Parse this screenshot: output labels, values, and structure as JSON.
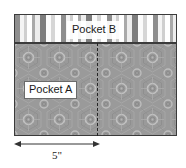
{
  "diagram": {
    "background_color": "#ffffff",
    "outline_color": "#3b3b3b"
  },
  "panels": [
    {
      "id": "pocket-b",
      "label": "Pocket B",
      "fill": "vertical-stripes",
      "fill_colors": [
        "#7d7d7d",
        "#8e8e8e",
        "#a9a9a9",
        "#cfcfcf",
        "#ededed",
        "#ffffff"
      ],
      "position": "top"
    },
    {
      "id": "pocket-a",
      "label": "Pocket A",
      "fill": "medallion-hexagon-print",
      "fill_colors": [
        "#9a9a9a",
        "#b4b4b4",
        "#868686"
      ],
      "position": "bottom"
    }
  ],
  "split_line": {
    "style": "dashed",
    "orientation": "vertical",
    "color": "#262626"
  },
  "dimension": {
    "label": "5\"",
    "value": 5,
    "unit": "inch",
    "arrow_style": "double-headed",
    "measures": "pocket-a-left-section-width"
  }
}
